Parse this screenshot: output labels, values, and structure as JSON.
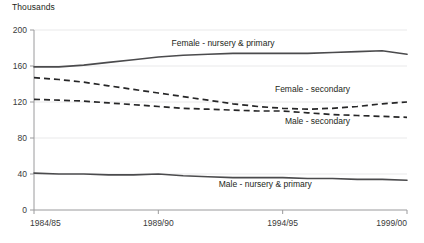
{
  "chart_data": {
    "type": "line",
    "title": "",
    "subtitle": "",
    "unit_label": "Thousands",
    "xlabel": "",
    "ylabel": "",
    "ylim": [
      0,
      200
    ],
    "yticks": [
      0,
      40,
      80,
      120,
      160,
      200
    ],
    "ytick_labels": [
      "0",
      "40",
      "80",
      "120",
      "160",
      "200"
    ],
    "grid": true,
    "legend_position": "inline-annotations",
    "x": [
      "1984/85",
      "1985/86",
      "1986/87",
      "1987/88",
      "1988/89",
      "1989/90",
      "1990/91",
      "1991/92",
      "1992/93",
      "1993/94",
      "1994/95",
      "1995/96",
      "1996/97",
      "1997/98",
      "1998/99",
      "1999/00"
    ],
    "xtick_labels": [
      "1984/85",
      "1989/90",
      "1994/95",
      "1999/00"
    ],
    "xtick_indices": [
      0,
      5,
      10,
      15
    ],
    "series": [
      {
        "name": "Female - nursery & primary",
        "style": "solid",
        "color": "#4b4b4d",
        "label_x_index": 7.6,
        "label_y_value": 182,
        "values": [
          159,
          159,
          161,
          164,
          167,
          170,
          172,
          173,
          174,
          174,
          174,
          174,
          175,
          176,
          177,
          173
        ]
      },
      {
        "name": "Female - secondary",
        "style": "dashed",
        "color": "#262627",
        "label_x_index": 11.2,
        "label_y_value": 131,
        "values": [
          147,
          145,
          142,
          138,
          134,
          130,
          126,
          122,
          118,
          115,
          113,
          112,
          113,
          115,
          118,
          120
        ]
      },
      {
        "name": "Male - secondary",
        "style": "dashed",
        "color": "#262627",
        "label_x_index": 11.4,
        "label_y_value": 96,
        "values": [
          123,
          122,
          121,
          119,
          117,
          115,
          113,
          112,
          111,
          110,
          110,
          108,
          106,
          105,
          104,
          103
        ]
      },
      {
        "name": "Male - nursery & primary",
        "style": "solid",
        "color": "#4b4b4d",
        "label_x_index": 9.3,
        "label_y_value": 26,
        "values": [
          41,
          40,
          40,
          39,
          39,
          40,
          38,
          37,
          36,
          36,
          36,
          35,
          35,
          34,
          34,
          33
        ]
      }
    ]
  }
}
